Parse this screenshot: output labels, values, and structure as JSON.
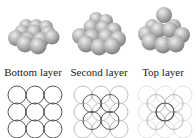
{
  "figure": {
    "panels": [
      {
        "id": "bottom",
        "label": "Bottom layer"
      },
      {
        "id": "second",
        "label": "Second layer"
      },
      {
        "id": "top",
        "label": "Top layer"
      }
    ]
  },
  "colors": {
    "sphere_fill": "#b4b4b4",
    "sphere_highlight": "#e6e6e6",
    "sphere_shadow": "#7a7a7a",
    "circle_dark": "#555555",
    "circle_light": "#bdbdbd",
    "circle_faint": "#dddddd"
  }
}
